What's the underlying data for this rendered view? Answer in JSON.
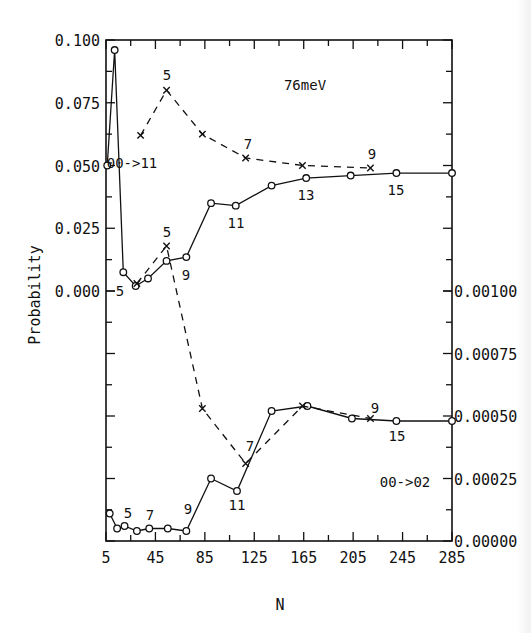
{
  "chart_data": {
    "type": "line",
    "title": "",
    "energy_label": "76meV",
    "xlabel": "N",
    "ylabel": "Probability",
    "xlim": [
      5,
      285
    ],
    "x_ticks": [
      5,
      45,
      85,
      125,
      165,
      205,
      245,
      285
    ],
    "x_tick_labels": [
      "5",
      "45",
      "85",
      "125",
      "165",
      "205",
      "245",
      "285"
    ],
    "left_axis": {
      "ylim": [
        0.0,
        0.1
      ],
      "ticks": [
        0.0,
        0.025,
        0.05,
        0.075,
        0.1
      ],
      "tick_labels": [
        "0.000",
        "0.025",
        "0.050",
        "0.075",
        "0.100"
      ],
      "applies_to": "upper panel (00->11)"
    },
    "right_axis": {
      "ylim": [
        0.0,
        0.001
      ],
      "ticks": [
        0.0,
        0.00025,
        0.0005,
        0.00075,
        0.001
      ],
      "tick_labels": [
        "0.00000",
        "0.00025",
        "0.00050",
        "0.00075",
        "0.00100"
      ],
      "applies_to": "lower panel (00->02)"
    },
    "legend_position": "inline annotations",
    "grid": false,
    "series": [
      {
        "name": "00->11 (solid, circles)",
        "axis": "left",
        "style": "solid",
        "marker": "circle",
        "x": [
          6,
          12,
          19,
          29,
          39,
          54,
          70,
          90,
          110,
          139,
          167,
          203,
          240,
          285
        ],
        "y": [
          0.05,
          0.096,
          0.0075,
          0.002,
          0.005,
          0.012,
          0.0135,
          0.035,
          0.034,
          0.042,
          0.045,
          0.046,
          0.047,
          0.047
        ]
      },
      {
        "name": "00->11 (dashed, crosses)",
        "axis": "left",
        "style": "dashed",
        "marker": "x",
        "x": [
          33,
          54,
          83,
          118,
          164,
          219
        ],
        "y": [
          0.062,
          0.08,
          0.0625,
          0.053,
          0.05,
          0.049
        ]
      },
      {
        "name": "00->02 (solid, circles)",
        "axis": "right",
        "style": "solid",
        "marker": "circle",
        "x": [
          8,
          14,
          20,
          30,
          40,
          55,
          70,
          90,
          111,
          139,
          168,
          204,
          240,
          285
        ],
        "y": [
          0.00011,
          5e-05,
          6e-05,
          4e-05,
          5e-05,
          5e-05,
          4e-05,
          0.00025,
          0.0002,
          0.00052,
          0.00054,
          0.00049,
          0.00048,
          0.00048
        ]
      },
      {
        "name": "00->02 (dashed, crosses)",
        "axis": "right",
        "style": "dashed",
        "marker": "x",
        "x": [
          30,
          54,
          83,
          118,
          164,
          219
        ],
        "y": [
          0.00103,
          0.00118,
          0.00053,
          0.00031,
          0.00054,
          0.00049
        ]
      }
    ],
    "annotations": [
      {
        "text": "76meV",
        "x": 305,
        "y": 90
      },
      {
        "text": "00->11",
        "x": 132,
        "y": 168
      },
      {
        "text": "5",
        "x": 167,
        "y": 80
      },
      {
        "text": "7",
        "x": 248,
        "y": 149
      },
      {
        "text": "9",
        "x": 372,
        "y": 159
      },
      {
        "text": "5",
        "x": 120,
        "y": 296
      },
      {
        "text": "5",
        "x": 167,
        "y": 237
      },
      {
        "text": "9",
        "x": 186,
        "y": 280
      },
      {
        "text": "11",
        "x": 236,
        "y": 228
      },
      {
        "text": "13",
        "x": 306,
        "y": 200
      },
      {
        "text": "15",
        "x": 396,
        "y": 195
      },
      {
        "text": "5",
        "x": 128,
        "y": 518
      },
      {
        "text": "7",
        "x": 150,
        "y": 520
      },
      {
        "text": "9",
        "x": 188,
        "y": 514
      },
      {
        "text": "11",
        "x": 237,
        "y": 510
      },
      {
        "text": "7",
        "x": 250,
        "y": 451
      },
      {
        "text": "9",
        "x": 375,
        "y": 413
      },
      {
        "text": "15",
        "x": 397,
        "y": 441
      },
      {
        "text": "00->02",
        "x": 405,
        "y": 487
      }
    ]
  }
}
